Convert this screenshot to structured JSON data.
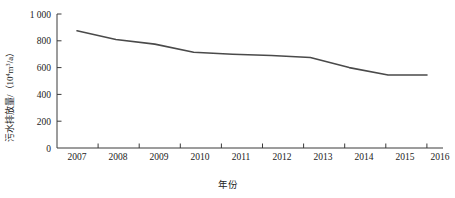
{
  "chart_data": {
    "type": "line",
    "title": "",
    "xlabel": "年份",
    "ylabel": "污水排放量/（10⁴m³/a）",
    "ylabel_main": "污水排放量/（10",
    "ylabel_exponent": "4",
    "ylabel_unit_mid": "m",
    "ylabel_unit_exponent": "3",
    "ylabel_unit_tail": "/a）",
    "categories": [
      "2007",
      "2008",
      "2009",
      "2010",
      "2011",
      "2012",
      "2013",
      "2014",
      "2015",
      "2016"
    ],
    "values": [
      875,
      810,
      775,
      715,
      700,
      690,
      675,
      600,
      545,
      545
    ],
    "series": [
      {
        "name": "污水排放量",
        "values": [
          875,
          810,
          775,
          715,
          700,
          690,
          675,
          600,
          545,
          545
        ]
      }
    ],
    "ylim": [
      0,
      1000
    ],
    "ytick_labels": [
      "1 000",
      "800",
      "600",
      "400",
      "200",
      "0"
    ],
    "ytick_values": [
      1000,
      800,
      600,
      400,
      200,
      0
    ],
    "xtick_labels": [
      "2007",
      "2008",
      "2009",
      "2010",
      "2011",
      "2012",
      "2013",
      "2014",
      "2015",
      "2016"
    ],
    "grid": false,
    "legend": false,
    "legend_position": "none",
    "line_color": "#4a4a4a",
    "axis_color": "#3a3a3a",
    "background_color": "#ffffff"
  }
}
